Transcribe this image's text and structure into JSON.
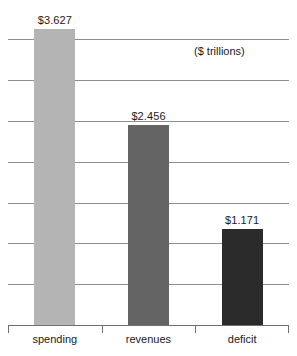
{
  "chart_data": {
    "type": "bar",
    "title": "",
    "subtitle": "",
    "xlabel": "",
    "ylabel": "",
    "unit_note": "($ trillions)",
    "categories": [
      "spending",
      "revenues",
      "deficit"
    ],
    "values": [
      3.627,
      2.456,
      1.171
    ],
    "value_labels": [
      "$3.627",
      "$2.456",
      "$1.171"
    ],
    "series": [
      {
        "name": "federal budget",
        "values": [
          3.627,
          2.456,
          1.171
        ]
      }
    ],
    "bar_colors": [
      "#b4b4b4",
      "#646464",
      "#2b2b2b"
    ],
    "ylim": [
      0,
      3.75
    ],
    "gridlines": [
      0.5,
      1.0,
      1.5,
      2.0,
      2.5,
      3.0,
      3.5
    ],
    "grid": true,
    "grid_color": "#8e8e8e",
    "axis_color": "#6f6f6f",
    "legend": "none",
    "legend_position": "none",
    "background": "#ffffff",
    "text_color": "#1a1a1a"
  }
}
